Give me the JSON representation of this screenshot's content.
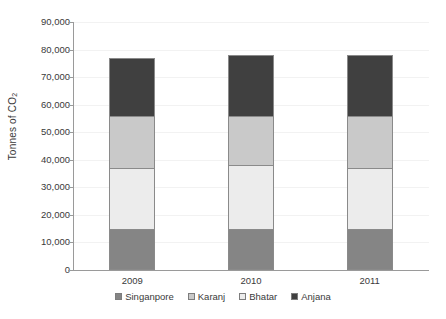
{
  "chart_data": {
    "type": "bar",
    "subtype": "stacked-bar",
    "title": "",
    "xlabel": "",
    "ylabel": "Tonnes of CO2",
    "ylabel_parts": {
      "text": "Tonnes of CO",
      "subscript": "2"
    },
    "categories": [
      "2009",
      "2010",
      "2011"
    ],
    "series": [
      {
        "name": "Singanpore",
        "color": "#858585",
        "values": [
          15000,
          15000,
          15000
        ]
      },
      {
        "name": "Bhatar",
        "color": "#ececec",
        "values": [
          22000,
          23000,
          22000
        ]
      },
      {
        "name": "Karanj",
        "color": "#c9c9c9",
        "values": [
          19000,
          18000,
          19000
        ]
      },
      {
        "name": "Anjana",
        "color": "#404040",
        "values": [
          21000,
          22000,
          22000
        ]
      }
    ],
    "stack_order_bottom_to_top": [
      "Singanpore",
      "Bhatar",
      "Karanj",
      "Anjana"
    ],
    "totals": [
      77000,
      78000,
      78000
    ],
    "ylim": [
      0,
      90000
    ],
    "ytick_step": 10000,
    "yticks": [
      0,
      10000,
      20000,
      30000,
      40000,
      50000,
      60000,
      70000,
      80000,
      90000
    ],
    "ytick_labels": [
      "0",
      "10,000",
      "20,000",
      "30,000",
      "40,000",
      "50,000",
      "60,000",
      "70,000",
      "80,000",
      "90,000"
    ],
    "grid": true,
    "grid_axis": "y",
    "grid_color": "#f2f2f2",
    "legend_position": "bottom",
    "axis_color": "#9a9a9a",
    "bar_border_color": "#8a8a8a",
    "background_color": "#ffffff"
  },
  "legend": {
    "items": [
      {
        "label": "Singanpore",
        "color": "#858585"
      },
      {
        "label": "Karanj",
        "color": "#c9c9c9"
      },
      {
        "label": "Bhatar",
        "color": "#ececec"
      },
      {
        "label": "Anjana",
        "color": "#404040"
      }
    ]
  }
}
